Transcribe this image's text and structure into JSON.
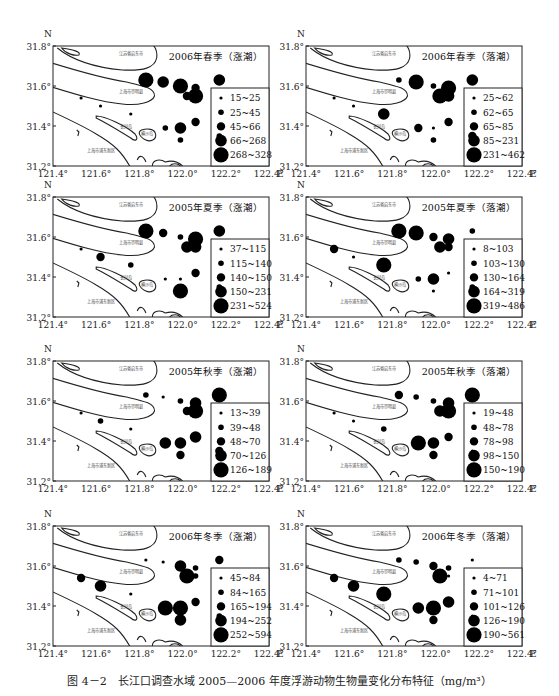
{
  "figure": {
    "caption": "图 4－2　长江口调查水域 2005—2006 年度浮游动物生物量变化分布特征（mg/m³）"
  },
  "map_labels": {
    "qidong": "江苏省启东市",
    "chongming": "上海市崇明县",
    "changxing": "长兴岛",
    "hengsha": "横沙岛",
    "pudong": "上海市浦东新区"
  },
  "axes": {
    "x_ticks": [
      "121.4°",
      "121.6°",
      "121.8°",
      "122.0°",
      "122.2°",
      "122.4°"
    ],
    "x_unit": "E",
    "y_ticks": [
      "31.8°",
      "31.6°",
      "31.4°",
      "31.2°"
    ],
    "y_unit": "N"
  },
  "chart_data": [
    {
      "type": "scatter",
      "title": "2006年春季（涨潮）",
      "xlabel": "E",
      "ylabel": "N",
      "xlim": [
        121.4,
        122.4
      ],
      "ylim": [
        31.2,
        31.8
      ],
      "legend": [
        "15~25",
        "25~45",
        "45~66",
        "66~268",
        "268~328"
      ],
      "points": [
        {
          "lon": 121.53,
          "lat": 31.54,
          "cls": 0
        },
        {
          "lon": 121.62,
          "lat": 31.5,
          "cls": 0
        },
        {
          "lon": 121.76,
          "lat": 31.46,
          "cls": 0
        },
        {
          "lon": 121.83,
          "lat": 31.63,
          "cls": 4
        },
        {
          "lon": 121.91,
          "lat": 31.62,
          "cls": 3
        },
        {
          "lon": 121.99,
          "lat": 31.6,
          "cls": 4
        },
        {
          "lon": 122.06,
          "lat": 31.59,
          "cls": 2
        },
        {
          "lon": 122.02,
          "lat": 31.55,
          "cls": 2
        },
        {
          "lon": 122.06,
          "lat": 31.55,
          "cls": 4
        },
        {
          "lon": 122.17,
          "lat": 31.63,
          "cls": 3
        },
        {
          "lon": 121.92,
          "lat": 31.39,
          "cls": 1
        },
        {
          "lon": 121.99,
          "lat": 31.39,
          "cls": 3
        },
        {
          "lon": 122.06,
          "lat": 31.42,
          "cls": 2
        },
        {
          "lon": 121.99,
          "lat": 31.33,
          "cls": 1
        },
        {
          "lon": 122.17,
          "lat": 31.35,
          "cls": 1
        }
      ]
    },
    {
      "type": "scatter",
      "title": "2006年春季（落潮）",
      "xlabel": "E",
      "ylabel": "N",
      "xlim": [
        121.4,
        122.4
      ],
      "ylim": [
        31.2,
        31.8
      ],
      "legend": [
        "25~62",
        "62~65",
        "65~85",
        "85~231",
        "231~462"
      ],
      "points": [
        {
          "lon": 121.53,
          "lat": 31.54,
          "cls": 0
        },
        {
          "lon": 121.62,
          "lat": 31.5,
          "cls": 0
        },
        {
          "lon": 121.76,
          "lat": 31.46,
          "cls": 3
        },
        {
          "lon": 121.83,
          "lat": 31.63,
          "cls": 1
        },
        {
          "lon": 121.91,
          "lat": 31.62,
          "cls": 4
        },
        {
          "lon": 121.99,
          "lat": 31.6,
          "cls": 1
        },
        {
          "lon": 122.06,
          "lat": 31.59,
          "cls": 4
        },
        {
          "lon": 122.02,
          "lat": 31.55,
          "cls": 4
        },
        {
          "lon": 122.06,
          "lat": 31.55,
          "cls": 3
        },
        {
          "lon": 122.17,
          "lat": 31.63,
          "cls": 3
        },
        {
          "lon": 121.92,
          "lat": 31.39,
          "cls": 2
        },
        {
          "lon": 121.99,
          "lat": 31.39,
          "cls": 0
        },
        {
          "lon": 122.06,
          "lat": 31.42,
          "cls": 2
        },
        {
          "lon": 121.99,
          "lat": 31.33,
          "cls": 1
        },
        {
          "lon": 122.17,
          "lat": 31.35,
          "cls": 2
        }
      ]
    },
    {
      "type": "scatter",
      "title": "2005年夏季（涨潮）",
      "xlabel": "E",
      "ylabel": "N",
      "xlim": [
        121.4,
        122.4
      ],
      "ylim": [
        31.2,
        31.8
      ],
      "legend": [
        "37~115",
        "115~140",
        "140~150",
        "150~231",
        "231~524"
      ],
      "points": [
        {
          "lon": 121.53,
          "lat": 31.54,
          "cls": 0
        },
        {
          "lon": 121.62,
          "lat": 31.5,
          "cls": 2
        },
        {
          "lon": 121.76,
          "lat": 31.46,
          "cls": 1
        },
        {
          "lon": 121.83,
          "lat": 31.63,
          "cls": 4
        },
        {
          "lon": 121.91,
          "lat": 31.62,
          "cls": 2
        },
        {
          "lon": 121.99,
          "lat": 31.6,
          "cls": 1
        },
        {
          "lon": 122.06,
          "lat": 31.59,
          "cls": 4
        },
        {
          "lon": 122.02,
          "lat": 31.55,
          "cls": 3
        },
        {
          "lon": 122.06,
          "lat": 31.55,
          "cls": 3
        },
        {
          "lon": 122.17,
          "lat": 31.63,
          "cls": 3
        },
        {
          "lon": 121.92,
          "lat": 31.39,
          "cls": 0
        },
        {
          "lon": 121.99,
          "lat": 31.39,
          "cls": 0
        },
        {
          "lon": 122.06,
          "lat": 31.42,
          "cls": 2
        },
        {
          "lon": 121.99,
          "lat": 31.33,
          "cls": 4
        },
        {
          "lon": 122.17,
          "lat": 31.35,
          "cls": 1
        }
      ]
    },
    {
      "type": "scatter",
      "title": "2005年夏季（落潮）",
      "xlabel": "E",
      "ylabel": "N",
      "xlim": [
        121.4,
        122.4
      ],
      "ylim": [
        31.2,
        31.8
      ],
      "legend": [
        "8~103",
        "103~130",
        "130~164",
        "164~319",
        "319~486"
      ],
      "points": [
        {
          "lon": 121.53,
          "lat": 31.54,
          "cls": 2
        },
        {
          "lon": 121.62,
          "lat": 31.5,
          "cls": 0
        },
        {
          "lon": 121.76,
          "lat": 31.46,
          "cls": 4
        },
        {
          "lon": 121.83,
          "lat": 31.63,
          "cls": 4
        },
        {
          "lon": 121.91,
          "lat": 31.62,
          "cls": 4
        },
        {
          "lon": 121.99,
          "lat": 31.6,
          "cls": 2
        },
        {
          "lon": 122.06,
          "lat": 31.59,
          "cls": 3
        },
        {
          "lon": 122.02,
          "lat": 31.55,
          "cls": 3
        },
        {
          "lon": 122.06,
          "lat": 31.55,
          "cls": 2
        },
        {
          "lon": 122.17,
          "lat": 31.63,
          "cls": 1
        },
        {
          "lon": 121.92,
          "lat": 31.39,
          "cls": 1
        },
        {
          "lon": 121.99,
          "lat": 31.39,
          "cls": 3
        },
        {
          "lon": 122.06,
          "lat": 31.42,
          "cls": 0
        },
        {
          "lon": 121.99,
          "lat": 31.33,
          "cls": 0
        },
        {
          "lon": 122.17,
          "lat": 31.35,
          "cls": 1
        }
      ]
    },
    {
      "type": "scatter",
      "title": "2005年秋季（涨潮）",
      "xlabel": "E",
      "ylabel": "N",
      "xlim": [
        121.4,
        122.4
      ],
      "ylim": [
        31.2,
        31.8
      ],
      "legend": [
        "13~39",
        "39~48",
        "48~70",
        "70~126",
        "126~189"
      ],
      "points": [
        {
          "lon": 121.53,
          "lat": 31.54,
          "cls": 0
        },
        {
          "lon": 121.62,
          "lat": 31.5,
          "cls": 1
        },
        {
          "lon": 121.76,
          "lat": 31.46,
          "cls": 0
        },
        {
          "lon": 121.83,
          "lat": 31.63,
          "cls": 1
        },
        {
          "lon": 121.91,
          "lat": 31.62,
          "cls": 0
        },
        {
          "lon": 121.99,
          "lat": 31.6,
          "cls": 1
        },
        {
          "lon": 122.06,
          "lat": 31.59,
          "cls": 3
        },
        {
          "lon": 122.02,
          "lat": 31.55,
          "cls": 2
        },
        {
          "lon": 122.06,
          "lat": 31.55,
          "cls": 4
        },
        {
          "lon": 122.17,
          "lat": 31.63,
          "cls": 4
        },
        {
          "lon": 121.92,
          "lat": 31.39,
          "cls": 3
        },
        {
          "lon": 121.99,
          "lat": 31.39,
          "cls": 3
        },
        {
          "lon": 122.06,
          "lat": 31.42,
          "cls": 3
        },
        {
          "lon": 121.99,
          "lat": 31.33,
          "cls": 2
        },
        {
          "lon": 122.17,
          "lat": 31.35,
          "cls": 2
        }
      ]
    },
    {
      "type": "scatter",
      "title": "2005年秋季（落潮）",
      "xlabel": "E",
      "ylabel": "N",
      "xlim": [
        121.4,
        122.4
      ],
      "ylim": [
        31.2,
        31.8
      ],
      "legend": [
        "19~48",
        "48~78",
        "78~98",
        "98~150",
        "150~190"
      ],
      "points": [
        {
          "lon": 121.53,
          "lat": 31.54,
          "cls": 0
        },
        {
          "lon": 121.62,
          "lat": 31.5,
          "cls": 0
        },
        {
          "lon": 121.76,
          "lat": 31.46,
          "cls": 1
        },
        {
          "lon": 121.83,
          "lat": 31.63,
          "cls": 2
        },
        {
          "lon": 121.91,
          "lat": 31.62,
          "cls": 1
        },
        {
          "lon": 121.99,
          "lat": 31.6,
          "cls": 1
        },
        {
          "lon": 122.06,
          "lat": 31.59,
          "cls": 3
        },
        {
          "lon": 122.02,
          "lat": 31.55,
          "cls": 3
        },
        {
          "lon": 122.06,
          "lat": 31.55,
          "cls": 4
        },
        {
          "lon": 122.17,
          "lat": 31.63,
          "cls": 4
        },
        {
          "lon": 121.92,
          "lat": 31.39,
          "cls": 4
        },
        {
          "lon": 121.99,
          "lat": 31.39,
          "cls": 3
        },
        {
          "lon": 122.06,
          "lat": 31.42,
          "cls": 2
        },
        {
          "lon": 121.99,
          "lat": 31.33,
          "cls": 2
        },
        {
          "lon": 122.17,
          "lat": 31.35,
          "cls": 0
        }
      ]
    },
    {
      "type": "scatter",
      "title": "2006年冬季（涨潮）",
      "xlabel": "E",
      "ylabel": "N",
      "xlim": [
        121.4,
        122.4
      ],
      "ylim": [
        31.2,
        31.8
      ],
      "legend": [
        "45~84",
        "84~165",
        "165~194",
        "194~252",
        "252~594"
      ],
      "points": [
        {
          "lon": 121.53,
          "lat": 31.54,
          "cls": 2
        },
        {
          "lon": 121.62,
          "lat": 31.5,
          "cls": 3
        },
        {
          "lon": 121.76,
          "lat": 31.46,
          "cls": 0
        },
        {
          "lon": 121.83,
          "lat": 31.63,
          "cls": 0
        },
        {
          "lon": 121.91,
          "lat": 31.62,
          "cls": 0
        },
        {
          "lon": 121.99,
          "lat": 31.6,
          "cls": 3
        },
        {
          "lon": 122.06,
          "lat": 31.59,
          "cls": 1
        },
        {
          "lon": 122.02,
          "lat": 31.55,
          "cls": 4
        },
        {
          "lon": 122.06,
          "lat": 31.55,
          "cls": 1
        },
        {
          "lon": 122.17,
          "lat": 31.63,
          "cls": 2
        },
        {
          "lon": 121.92,
          "lat": 31.39,
          "cls": 4
        },
        {
          "lon": 121.99,
          "lat": 31.39,
          "cls": 4
        },
        {
          "lon": 122.06,
          "lat": 31.42,
          "cls": 2
        },
        {
          "lon": 121.99,
          "lat": 31.33,
          "cls": 3
        },
        {
          "lon": 122.17,
          "lat": 31.35,
          "cls": 1
        }
      ]
    },
    {
      "type": "scatter",
      "title": "2006年冬季（落潮）",
      "xlabel": "E",
      "ylabel": "N",
      "xlim": [
        121.4,
        122.4
      ],
      "ylim": [
        31.2,
        31.8
      ],
      "legend": [
        "4~71",
        "71~101",
        "101~126",
        "126~190",
        "190~561"
      ],
      "points": [
        {
          "lon": 121.53,
          "lat": 31.54,
          "cls": 2
        },
        {
          "lon": 121.62,
          "lat": 31.5,
          "cls": 3
        },
        {
          "lon": 121.76,
          "lat": 31.46,
          "cls": 4
        },
        {
          "lon": 121.83,
          "lat": 31.63,
          "cls": 1
        },
        {
          "lon": 121.91,
          "lat": 31.62,
          "cls": 1
        },
        {
          "lon": 121.99,
          "lat": 31.6,
          "cls": 2
        },
        {
          "lon": 122.06,
          "lat": 31.59,
          "cls": 1
        },
        {
          "lon": 122.02,
          "lat": 31.55,
          "cls": 4
        },
        {
          "lon": 122.06,
          "lat": 31.55,
          "cls": 0
        },
        {
          "lon": 122.17,
          "lat": 31.63,
          "cls": 0
        },
        {
          "lon": 121.92,
          "lat": 31.39,
          "cls": 3
        },
        {
          "lon": 121.99,
          "lat": 31.39,
          "cls": 4
        },
        {
          "lon": 122.06,
          "lat": 31.42,
          "cls": 3
        },
        {
          "lon": 121.99,
          "lat": 31.33,
          "cls": 2
        },
        {
          "lon": 122.17,
          "lat": 31.35,
          "cls": 0
        }
      ]
    }
  ]
}
